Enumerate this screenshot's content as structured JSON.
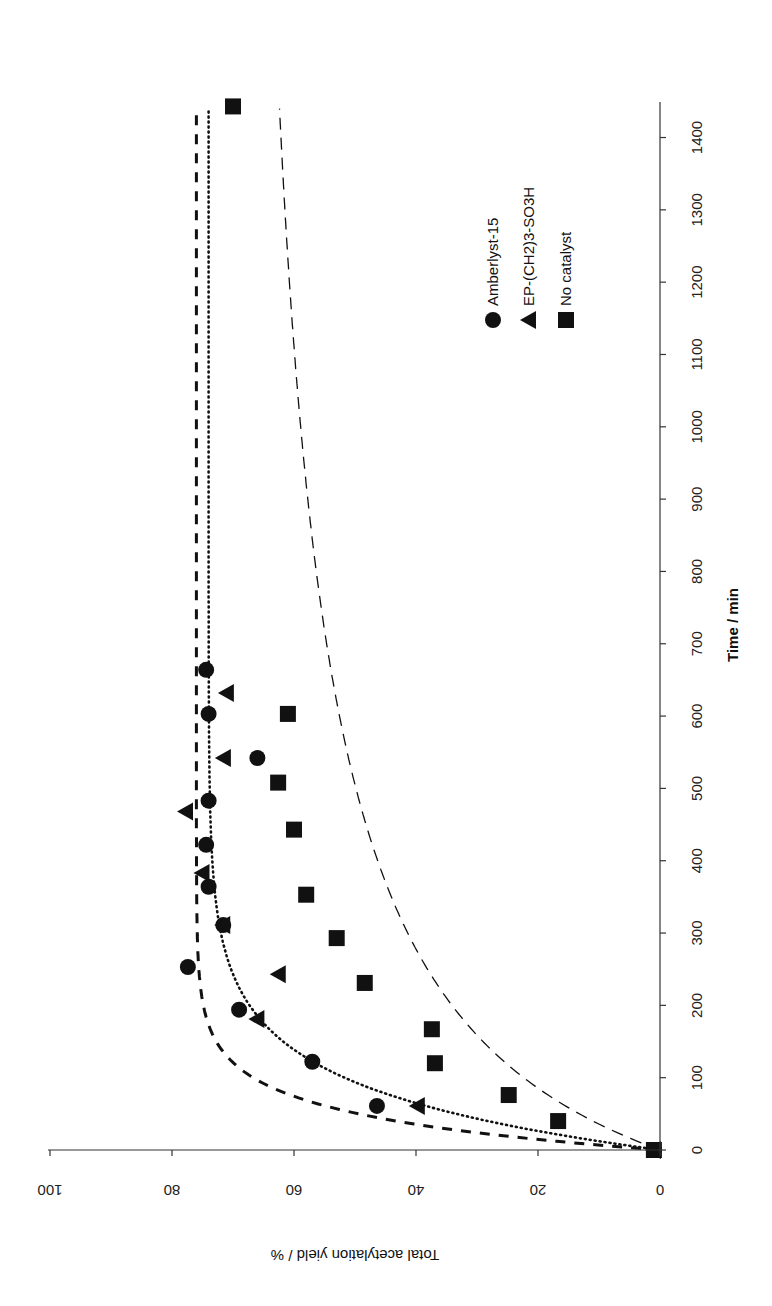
{
  "chart_data": {
    "type": "scatter",
    "title": "",
    "orientation_note": "figure rotated 90° clockwise: time axis runs vertically on right side (increasing upward), yield axis runs horizontally along bottom (increasing leftward), text upside-down/rotated",
    "xlabel": "Time / min",
    "ylabel": "Total acetylation yield / %",
    "xlim": [
      0,
      1450
    ],
    "ylim": [
      0,
      100
    ],
    "x_ticks": [
      0,
      100,
      200,
      300,
      400,
      500,
      600,
      700,
      800,
      900,
      1000,
      1100,
      1200,
      1300,
      1400
    ],
    "y_ticks": [
      0,
      20,
      40,
      60,
      80,
      100
    ],
    "grid": false,
    "legend_position": "upper right (in rotated view)",
    "series": [
      {
        "name": "Amberlyst-15",
        "marker": "circle",
        "fit_line": "thick-dashed",
        "x": [
          0,
          61,
          122,
          194,
          253,
          311,
          364,
          422,
          483,
          542,
          603,
          664
        ],
        "y": [
          1,
          46.4,
          57,
          69,
          77.4,
          71.6,
          74,
          74.4,
          74,
          66,
          74,
          74.4
        ]
      },
      {
        "name": "EP-(CH2)3-SO3H",
        "marker": "triangle",
        "fit_line": "dotted",
        "x": [
          0,
          61,
          181,
          243,
          311,
          383,
          468,
          542,
          632
        ],
        "y": [
          1,
          39.7,
          66,
          62.5,
          71.6,
          75,
          77.7,
          71.5,
          71
        ]
      },
      {
        "name": "No catalyst",
        "marker": "square",
        "fit_line": "thin-dashed",
        "x": [
          0,
          40,
          76,
          120,
          167,
          231,
          293,
          353,
          443,
          508,
          603,
          1443
        ],
        "y": [
          1,
          16.7,
          24.8,
          36.9,
          37.4,
          48.4,
          53,
          58,
          60,
          62.6,
          61,
          70
        ]
      }
    ],
    "fits": [
      {
        "series": "Amberlyst-15",
        "style": "thick-dashed",
        "plateau": 76,
        "k": 0.021
      },
      {
        "series": "EP-(CH2)3-SO3H",
        "style": "dotted",
        "plateau": 74,
        "k": 0.012
      },
      {
        "series": "No catalyst",
        "style": "thin-dashed",
        "plateau": 72,
        "k": 0.0045,
        "shape": "hyperbolic"
      }
    ]
  },
  "labels": {
    "x_axis_title": "Time / min",
    "y_axis_title": "Total acetylation yield / %",
    "legend": [
      "Amberlyst-15",
      "EP-(CH2)3-SO3H",
      "No catalyst"
    ]
  },
  "colors": {
    "ink": "#111111",
    "axis": "#333333",
    "background": "#ffffff"
  }
}
